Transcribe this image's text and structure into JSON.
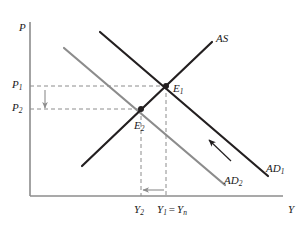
{
  "figure": {
    "type": "economics-diagram",
    "background_color": "#ffffff"
  },
  "axes": {
    "y_axis_label": "P",
    "x_axis_label": "Y",
    "axis_color": "#8c8c8c",
    "origin": {
      "x": 30,
      "y": 196
    },
    "x_end": {
      "x": 283,
      "y": 196
    },
    "y_top": {
      "x": 30,
      "y": 22
    }
  },
  "curves": [
    {
      "id": "as",
      "label": "AS",
      "color": "#231f20",
      "width": 2.2,
      "from": {
        "x": 82,
        "y": 166
      },
      "to": {
        "x": 212,
        "y": 42
      },
      "label_pos": {
        "x": 216,
        "y": 33
      }
    },
    {
      "id": "ad1",
      "label": "AD",
      "sub": "1",
      "color": "#231f20",
      "width": 2.2,
      "from": {
        "x": 100,
        "y": 32
      },
      "to": {
        "x": 268,
        "y": 176
      },
      "label_pos": {
        "x": 266,
        "y": 163
      }
    },
    {
      "id": "ad2",
      "label": "AD",
      "sub": "2",
      "color": "#8c8c8c",
      "width": 2.2,
      "from": {
        "x": 64,
        "y": 48
      },
      "to": {
        "x": 225,
        "y": 185
      },
      "label_pos": {
        "x": 224,
        "y": 175
      }
    }
  ],
  "points": [
    {
      "id": "e1",
      "label": "E",
      "sub": "1",
      "x": 166,
      "y": 86,
      "label_pos": {
        "x": 173,
        "y": 83
      },
      "dot_color": "#231f20",
      "dot_radius": 3
    },
    {
      "id": "e2",
      "label": "E",
      "sub": "2",
      "x": 141,
      "y": 109,
      "label_pos": {
        "x": 134,
        "y": 120
      },
      "dot_color": "#231f20",
      "dot_radius": 3
    }
  ],
  "price_ticks": [
    {
      "id": "p1",
      "label": "P",
      "sub": "1",
      "y": 86,
      "label_pos": {
        "x": 12,
        "y": 81
      }
    },
    {
      "id": "p2",
      "label": "P",
      "sub": "2",
      "y": 109,
      "label_pos": {
        "x": 12,
        "y": 104
      }
    }
  ],
  "output_ticks": [
    {
      "id": "y2",
      "label": "Y",
      "sub": "2",
      "x": 141,
      "label_pos": {
        "x": 134,
        "y": 205
      }
    },
    {
      "id": "y1",
      "label": "Y",
      "sub": "1",
      "equals": "=",
      "label2": "Y",
      "sub2": "n",
      "x": 166,
      "label_pos": {
        "x": 158,
        "y": 205
      }
    }
  ],
  "guides": {
    "color": "#8c8c8c",
    "dash": "4,3",
    "width": 1,
    "horizontal": [
      {
        "id": "p1-guide",
        "from_x": 30,
        "to_x": 166,
        "y": 86
      },
      {
        "id": "p2-guide",
        "from_x": 30,
        "to_x": 141,
        "y": 109
      }
    ],
    "vertical": [
      {
        "id": "y1-guide",
        "x": 166,
        "from_y": 86,
        "to_y": 196
      },
      {
        "id": "y2-guide",
        "x": 141,
        "from_y": 109,
        "to_y": 196
      }
    ]
  },
  "arrows": [
    {
      "id": "price-fall-arrow",
      "direction": "down",
      "color": "#8c8c8c",
      "from": {
        "x": 45,
        "y": 90
      },
      "to": {
        "x": 45,
        "y": 108
      }
    },
    {
      "id": "output-fall-arrow",
      "direction": "left",
      "color": "#8c8c8c",
      "from": {
        "x": 164,
        "y": 190
      },
      "to": {
        "x": 143,
        "y": 190
      }
    },
    {
      "id": "ad-shift-arrow",
      "direction": "down-left",
      "color": "#231f20",
      "from": {
        "x": 231,
        "y": 161
      },
      "to": {
        "x": 209,
        "y": 140
      }
    }
  ]
}
